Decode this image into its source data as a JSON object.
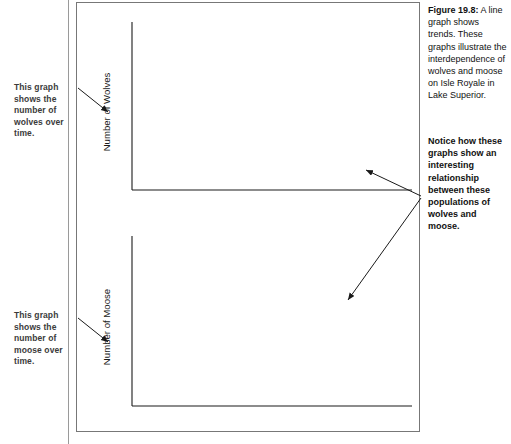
{
  "figure": {
    "label": "Figure 19.8:",
    "caption_body": " A line graph shows trends. These graphs illustrate the interdependence of wolves and moose on Isle Royale in Lake Superior.",
    "caption_note": "Notice how these graphs show an interesting relationship between these populations of wolves and moose."
  },
  "annotations": {
    "wolves_note": "This graph shows the number of wolves over time.",
    "moose_note": "This graph shows the number of moose over time.",
    "arrow_icon": "arrow-pointer-icon"
  },
  "chart_data": [
    {
      "type": "line",
      "title": "Population of Wolves and Moose on Isle Royale",
      "xlabel": "",
      "ylabel": "Number of Wolves",
      "xlim": [
        1959,
        2008
      ],
      "ylim": [
        10,
        50
      ],
      "yticks": [
        10,
        20,
        30,
        40,
        50
      ],
      "xticks": [
        1960,
        1970,
        1980,
        1990,
        2000,
        2008
      ],
      "xtick_labels": [
        "1960",
        "1970",
        "1980",
        "1990",
        "2000",
        "2008"
      ],
      "ytick_labels": [
        "10",
        "20",
        "30",
        "40",
        "50"
      ],
      "minor_x_step": 1,
      "grid": false,
      "legend": false,
      "series": [
        {
          "name": "Wolves",
          "x": [
            1959,
            1960,
            1961,
            1962,
            1963,
            1964,
            1965,
            1966,
            1967,
            1968,
            1969,
            1970,
            1971,
            1972,
            1973,
            1974,
            1975,
            1976,
            1977,
            1978,
            1979,
            1980,
            1981,
            1982,
            1983,
            1984,
            1985,
            1986,
            1987,
            1988,
            1989,
            1990,
            1991,
            1992,
            1993,
            1994,
            1995,
            1996,
            1997,
            1998,
            1999,
            2000,
            2001,
            2002,
            2003,
            2004,
            2005,
            2006,
            2007,
            2008
          ],
          "values": [
            23,
            22,
            22,
            23,
            20,
            26,
            28,
            26,
            22,
            22,
            17,
            18,
            20,
            23,
            24,
            31,
            41,
            44,
            34,
            40,
            43,
            50,
            30,
            14,
            23,
            24,
            22,
            20,
            16,
            12,
            12,
            15,
            12,
            12,
            13,
            17,
            16,
            22,
            24,
            14,
            25,
            29,
            19,
            17,
            19,
            29,
            30,
            30,
            21,
            23
          ]
        }
      ]
    },
    {
      "type": "line",
      "title": "",
      "xlabel": "",
      "ylabel": "Number of Moose",
      "xlim": [
        1959,
        2008
      ],
      "ylim": [
        0,
        2500
      ],
      "yticks": [
        0,
        500,
        1000,
        1500,
        2000,
        2500
      ],
      "xticks": [
        1960,
        1970,
        1980,
        1990,
        2000,
        2008
      ],
      "xtick_labels": [
        "1960",
        "1970",
        "1980",
        "1990",
        "2000",
        "2008"
      ],
      "ytick_labels": [
        "0",
        "500",
        "1000",
        "1500",
        "2000",
        "2500"
      ],
      "minor_x_step": 1,
      "grid": false,
      "legend": false,
      "series": [
        {
          "name": "Moose",
          "x": [
            1959,
            1960,
            1961,
            1962,
            1963,
            1964,
            1965,
            1966,
            1967,
            1968,
            1969,
            1970,
            1971,
            1972,
            1973,
            1974,
            1975,
            1976,
            1977,
            1978,
            1979,
            1980,
            1981,
            1982,
            1983,
            1984,
            1985,
            1986,
            1987,
            1988,
            1989,
            1990,
            1991,
            1992,
            1993,
            1994,
            1995,
            1996,
            1997,
            1998,
            1999,
            2000,
            2001,
            2002,
            2003,
            2004,
            2005,
            2006,
            2007,
            2008
          ],
          "values": [
            604,
            625,
            650,
            660,
            680,
            700,
            720,
            740,
            780,
            800,
            830,
            1000,
            1150,
            1300,
            1350,
            1400,
            1480,
            1430,
            1500,
            1460,
            1400,
            1250,
            1100,
            1000,
            900,
            850,
            880,
            870,
            800,
            780,
            800,
            900,
            1000,
            1200,
            1300,
            1250,
            1400,
            1550,
            1750,
            1700,
            2100,
            2400,
            1600,
            500,
            550,
            750,
            800,
            950,
            1100,
            1000
          ]
        }
      ]
    }
  ]
}
